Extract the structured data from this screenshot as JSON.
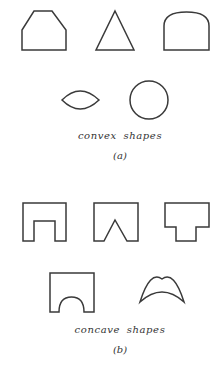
{
  "figure": {
    "panel_a": {
      "caption": "convex shapes",
      "label": "(a)",
      "shapes": [
        "truncated-pentagon",
        "triangle",
        "arch",
        "lens",
        "circle"
      ]
    },
    "panel_b": {
      "caption": "concave shapes",
      "label": "(b)",
      "shapes": [
        "square-notch",
        "v-notch",
        "t-shape",
        "arch-cutout",
        "crescent"
      ]
    },
    "stroke_color": "#3a3a3a"
  }
}
